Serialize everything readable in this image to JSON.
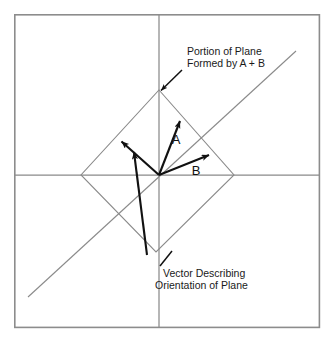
{
  "figure": {
    "title_visible": false,
    "background_color": "#ffffff",
    "frame": {
      "name": "figure-border",
      "x": 14,
      "y": 14,
      "width": 306,
      "height": 314,
      "stroke_color": "#8c8c8c",
      "stroke_width": 1.6
    },
    "axes": {
      "origin": {
        "x": 159,
        "y": 175
      },
      "horizontal": {
        "label": "horizontal-axis",
        "x1": 15,
        "y1": 175,
        "x2": 319,
        "y2": 175,
        "stroke_color": "#8a8a8a"
      },
      "vertical": {
        "label": "vertical-axis",
        "x1": 159,
        "y1": 15,
        "x2": 159,
        "y2": 327,
        "stroke_color": "#8a8a8a"
      },
      "diagonal": {
        "label": "diagonal-axis",
        "x1": 28,
        "y1": 297,
        "x2": 296,
        "y2": 51,
        "stroke_color": "#8a8a8a"
      }
    },
    "plane_patch": {
      "name": "plane-parallelogram",
      "description": "Portion of plane formed by A + B",
      "stroke_color": "#8a8a8a",
      "points": "159,90 234,175 156,252 81,175"
    },
    "vectors": [
      {
        "name": "vector-a",
        "letter": "A",
        "from": {
          "x": 159,
          "y": 175
        },
        "to": {
          "x": 180,
          "y": 121
        },
        "letter_pos": {
          "x": 176,
          "y": 144
        },
        "stroke_color": "#111111"
      },
      {
        "name": "vector-b",
        "letter": "B",
        "from": {
          "x": 159,
          "y": 175
        },
        "to": {
          "x": 209,
          "y": 155
        },
        "letter_pos": {
          "x": 196,
          "y": 175
        },
        "stroke_color": "#111111"
      },
      {
        "name": "vector-normal-long",
        "letter": "",
        "from": {
          "x": 159,
          "y": 175
        },
        "to": {
          "x": 121,
          "y": 141
        },
        "letter_pos": null,
        "stroke_color": "#111111"
      },
      {
        "name": "vector-normal-short",
        "letter": "",
        "from": {
          "x": 147,
          "y": 255
        },
        "to": {
          "x": 134,
          "y": 152
        },
        "letter_pos": null,
        "stroke_color": "#111111"
      }
    ],
    "callouts": [
      {
        "name": "callout-portion-of-plane",
        "lines": [
          "Portion of Plane",
          "Formed by A + B"
        ],
        "text_x": 187,
        "text_y": 57,
        "line_height": 12,
        "leader": {
          "x1": 182,
          "y1": 70,
          "x2": 160,
          "y2": 91
        },
        "has_arrowhead": true
      },
      {
        "name": "callout-vector-orientation",
        "lines": [
          "Vector Describing",
          "Orientation of Plane"
        ],
        "text_x": 163,
        "text_y": 275,
        "line_height": 12,
        "leader": {
          "x1": 160,
          "y1": 266,
          "x2": 171,
          "y2": 252
        },
        "has_arrowhead": false
      }
    ],
    "colors": {
      "ink": "#111111",
      "guide": "#8a8a8a",
      "frame": "#8c8c8c",
      "page": "#ffffff"
    }
  }
}
